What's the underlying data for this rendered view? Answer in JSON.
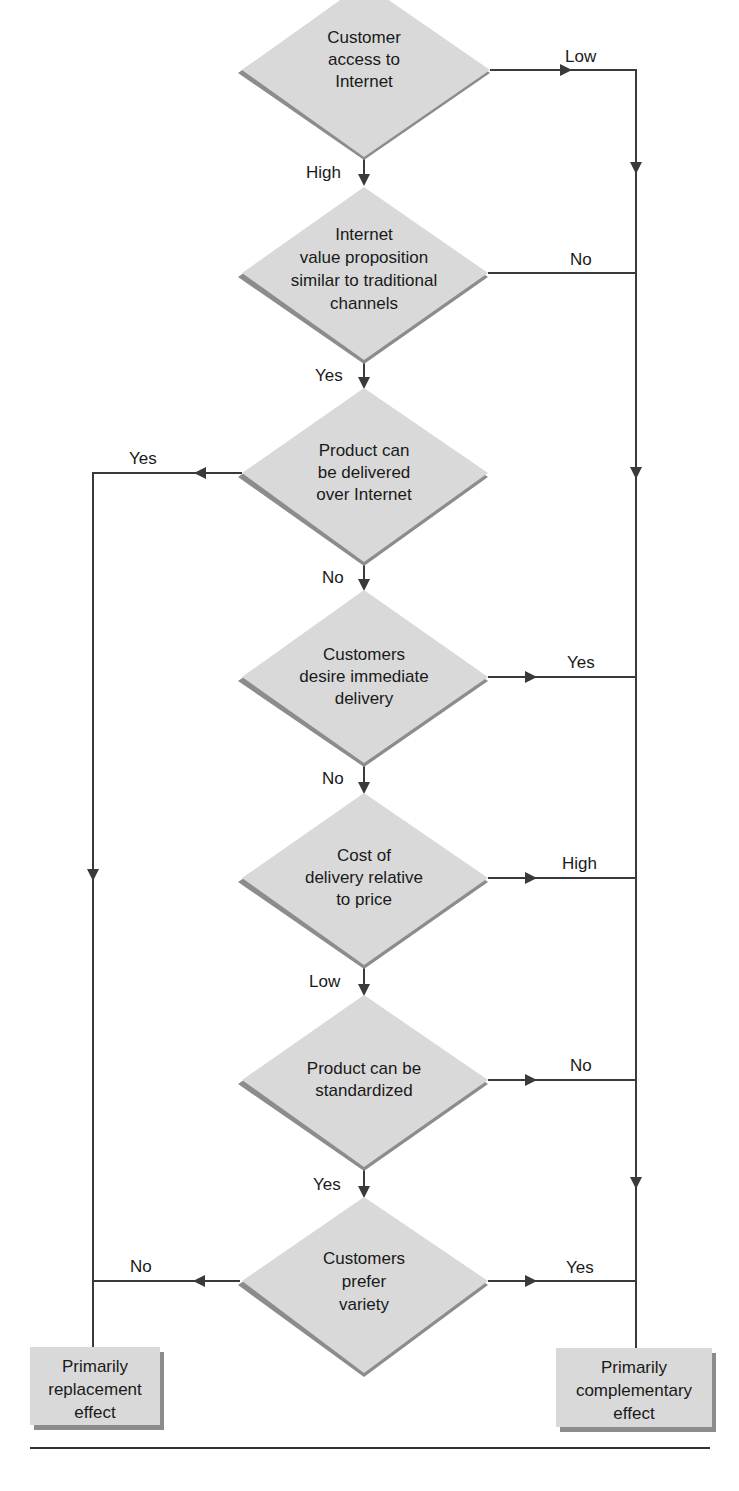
{
  "figure": {
    "type": "flowchart",
    "colors": {
      "node_fill": "#d9d9d9",
      "node_shadow": "#8c8c8c",
      "line": "#3a3a3a",
      "text": "#1a1a1a",
      "background": "#ffffff"
    },
    "decisions": [
      {
        "id": "d1",
        "lines": [
          "Customer",
          "access to",
          "Internet"
        ]
      },
      {
        "id": "d2",
        "lines": [
          "Internet",
          "value proposition",
          "similar to traditional",
          "channels"
        ]
      },
      {
        "id": "d3",
        "lines": [
          "Product can",
          "be delivered",
          "over Internet"
        ]
      },
      {
        "id": "d4",
        "lines": [
          "Customers",
          "desire immediate",
          "delivery"
        ]
      },
      {
        "id": "d5",
        "lines": [
          "Cost of",
          "delivery relative",
          "to price"
        ]
      },
      {
        "id": "d6",
        "lines": [
          "Product can be",
          "standardized"
        ]
      },
      {
        "id": "d7",
        "lines": [
          "Customers",
          "prefer",
          "variety"
        ]
      }
    ],
    "outcomes": {
      "left": {
        "lines": [
          "Primarily",
          "replacement",
          "effect"
        ]
      },
      "right": {
        "lines": [
          "Primarily",
          "complementary",
          "effect"
        ]
      }
    },
    "edges": {
      "d1_right": "Low",
      "d1_down": "High",
      "d2_right": "No",
      "d2_down": "Yes",
      "d3_left": "Yes",
      "d3_down": "No",
      "d4_right": "Yes",
      "d4_down": "No",
      "d5_right": "High",
      "d5_down": "Low",
      "d6_right": "No",
      "d6_down": "Yes",
      "d7_left": "No",
      "d7_right": "Yes"
    }
  }
}
